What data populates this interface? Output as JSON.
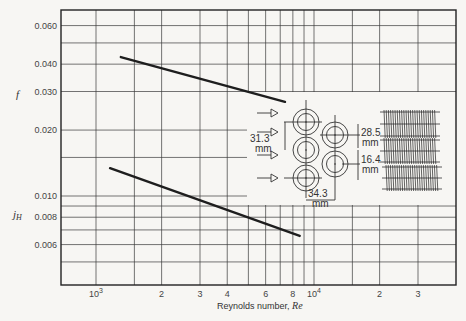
{
  "chart_data": {
    "type": "line",
    "title": "",
    "xlabel": "Reynolds number, Re",
    "ylabel_upper": "f",
    "ylabel_lower": "jH",
    "xscale": "log",
    "yscale": "log",
    "xlim": [
      850,
      40000
    ],
    "ylim": [
      0.0043,
      0.067
    ],
    "grid": true,
    "x_tick_labels": [
      "10³",
      "2",
      "3",
      "4",
      "6",
      "8",
      "10⁴",
      "2",
      "3"
    ],
    "x_tick_values": [
      1000,
      2000,
      3000,
      4000,
      6000,
      8000,
      10000,
      20000,
      30000
    ],
    "y_tick_labels": [
      "0.060",
      "0.040",
      "0.030",
      "0.020",
      "0.010",
      "0.008",
      "0.006"
    ],
    "y_tick_values": [
      0.06,
      0.04,
      0.03,
      0.02,
      0.01,
      0.008,
      0.006
    ],
    "series": [
      {
        "name": "f",
        "x": [
          1300,
          7360
        ],
        "y": [
          0.0431,
          0.0269
        ]
      },
      {
        "name": "jH",
        "x": [
          1160,
          8600
        ],
        "y": [
          0.0134,
          0.00657
        ]
      }
    ],
    "inset": {
      "description": "Staggered tube bank geometry with flow arrows and finned tube side view",
      "dimensions": [
        "31.3 mm",
        "28.5 mm",
        "16.4 mm",
        "34.3 mm"
      ]
    }
  },
  "labels": {
    "y_upper": "f",
    "y_lower_main": "j",
    "y_lower_sub": "H",
    "x_axis_prefix": "Reynolds number, ",
    "x_axis_var": "Re",
    "x_ticks": [
      {
        "label": "10",
        "sup": "3"
      },
      {
        "label": "2"
      },
      {
        "label": "3"
      },
      {
        "label": "4"
      },
      {
        "label": "6"
      },
      {
        "label": "8"
      },
      {
        "label": "10",
        "sup": "4"
      },
      {
        "label": "2"
      },
      {
        "label": "3"
      }
    ],
    "y_ticks": [
      "0.060",
      "0.040",
      "0.030",
      "0.020",
      "0.010",
      "0.008",
      "0.006"
    ],
    "dim_transverse": "31.3",
    "dim_transverse_unit": "mm",
    "dim_pitch_a": "28.5",
    "dim_pitch_a_unit": "mm",
    "dim_pitch_b": "16.4",
    "dim_pitch_b_unit": "mm",
    "dim_longitudinal": "34.3",
    "dim_longitudinal_unit": "mm"
  }
}
